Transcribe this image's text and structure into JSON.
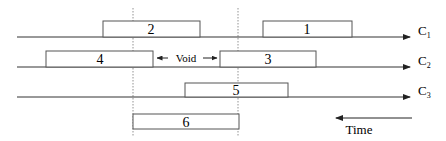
{
  "diagram": {
    "channels": [
      {
        "id": "c1",
        "label": "C",
        "subscript": "1",
        "y": 37
      },
      {
        "id": "c2",
        "label": "C",
        "subscript": "2",
        "y": 67
      },
      {
        "id": "c3",
        "label": "C",
        "subscript": "3",
        "y": 97
      }
    ],
    "boxes": [
      {
        "id": "box-2",
        "label": "2",
        "channel": "c1",
        "x1": 103,
        "x2": 200
      },
      {
        "id": "box-1",
        "label": "1",
        "channel": "c1",
        "x1": 263,
        "x2": 352
      },
      {
        "id": "box-4",
        "label": "4",
        "channel": "c2",
        "x1": 46,
        "x2": 153
      },
      {
        "id": "box-3",
        "label": "3",
        "channel": "c2",
        "x1": 220,
        "x2": 316
      },
      {
        "id": "box-5",
        "label": "5",
        "channel": "c3",
        "x1": 185,
        "x2": 288
      },
      {
        "id": "box-6",
        "label": "6",
        "channel": "none",
        "x1": 133,
        "x2": 239
      }
    ],
    "void": {
      "label": "Void",
      "x1": 153,
      "x2": 220
    },
    "dashed_guides_x": [
      133,
      238
    ],
    "time": {
      "label": "Time",
      "direction": "right-to-left"
    },
    "colors": {
      "line": "#333333",
      "box_border": "#555555",
      "guide": "#777777"
    }
  }
}
